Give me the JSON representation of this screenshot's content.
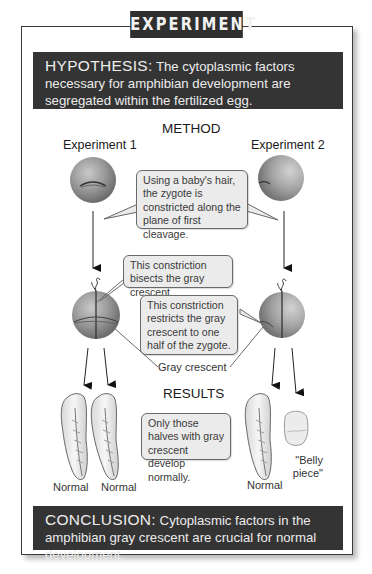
{
  "title": "EXPERIMENT",
  "hypothesis": {
    "keyword": "HYPOTHESIS:",
    "text": " The cytoplasmic factors necessary for amphibian development are segregated within the fertilized egg."
  },
  "method": {
    "heading": "METHOD",
    "experiment1_label": "Experiment 1",
    "experiment2_label": "Experiment 2",
    "callout_constriction": "Using a baby's hair, the zygote is constricted along the plane of first cleavage.",
    "callout_bisects": "This constriction bisects the gray crescent.",
    "callout_restricts": "This constriction restricts the gray crescent to one half of the zygote.",
    "gray_crescent_label": "Gray crescent"
  },
  "results": {
    "heading": "RESULTS",
    "callout": "Only those halves with gray crescent develop normally.",
    "exp1_outcomes": [
      "Normal",
      "Normal"
    ],
    "exp2_outcomes": [
      "Normal",
      "\"Belly piece\""
    ]
  },
  "conclusion": {
    "keyword": "CONCLUSION:",
    "text": " Cytoplasmic factors in the amphibian gray crescent are crucial for normal development."
  },
  "colors": {
    "banner_bg": "#343434",
    "callout_bg": "#ebebeb",
    "zygote": "#8a8a8a"
  }
}
